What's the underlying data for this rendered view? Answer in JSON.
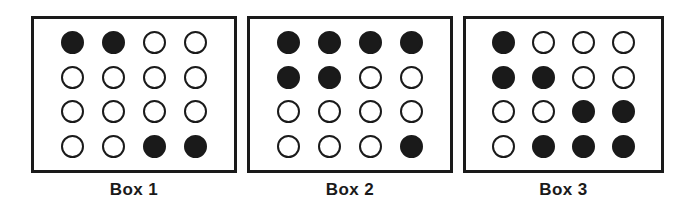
{
  "figure": {
    "background_color": "#ffffff",
    "ink_color": "#1a1a1a",
    "filled_marble_color": "#1a1a1a",
    "empty_marble_color": "#ffffff"
  },
  "chart_data": {
    "type": "table",
    "title": "",
    "subtitle": "",
    "xlabel": "",
    "ylabel": "",
    "legend": [],
    "grid": false,
    "rows": 4,
    "columns": 4,
    "symbols": {
      "filled": "●",
      "empty": "○"
    },
    "categories": [
      "Box 1",
      "Box 2",
      "Box 3"
    ],
    "values": [
      4,
      7,
      8
    ],
    "series": [
      {
        "name": "filled_count",
        "values": [
          4,
          7,
          8
        ]
      },
      {
        "name": "empty_count",
        "values": [
          12,
          9,
          8
        ]
      },
      {
        "name": "total_count",
        "values": [
          16,
          16,
          16
        ]
      }
    ],
    "boxes": [
      {
        "label": "Box 1",
        "filled_count": 4,
        "empty_count": 12,
        "total_count": 16,
        "grid": [
          [
            true,
            true,
            false,
            false
          ],
          [
            false,
            false,
            false,
            false
          ],
          [
            false,
            false,
            false,
            false
          ],
          [
            false,
            false,
            true,
            true
          ]
        ]
      },
      {
        "label": "Box 2",
        "filled_count": 7,
        "empty_count": 9,
        "total_count": 16,
        "grid": [
          [
            true,
            true,
            true,
            true
          ],
          [
            true,
            true,
            false,
            false
          ],
          [
            false,
            false,
            false,
            false
          ],
          [
            false,
            false,
            false,
            true
          ]
        ]
      },
      {
        "label": "Box 3",
        "filled_count": 8,
        "empty_count": 8,
        "total_count": 16,
        "grid": [
          [
            true,
            false,
            false,
            false
          ],
          [
            true,
            true,
            false,
            false
          ],
          [
            false,
            false,
            true,
            true
          ],
          [
            false,
            true,
            true,
            true
          ]
        ]
      }
    ]
  }
}
